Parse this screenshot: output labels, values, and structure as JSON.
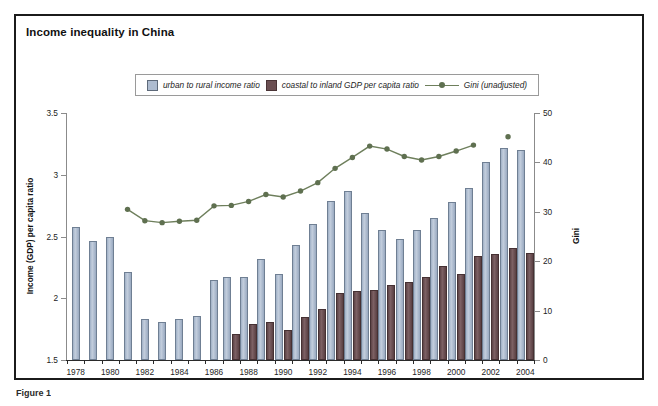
{
  "figure": {
    "title": "Income inequality in China",
    "caption": "Figure 1"
  },
  "legend": {
    "items": [
      {
        "key": "urban_rural",
        "label": "urban to rural income ratio",
        "marker": "blue-square-swatch",
        "color": "#aebcd0"
      },
      {
        "key": "coastal_inland",
        "label": "coastal to inland GDP per capita ratio",
        "marker": "maroon-square-swatch",
        "color": "#6b4f52"
      },
      {
        "key": "gini",
        "label": "Gini (unadjusted)",
        "marker": "line-with-dot",
        "color": "#6e7f5c"
      }
    ]
  },
  "chart_data": {
    "type": "bar",
    "title": "Income inequality in China",
    "xlabel": "",
    "ylabel": "Income (GDP) per capita ratio",
    "y2label": "Gini",
    "ylim": [
      1.5,
      3.5
    ],
    "y2lim": [
      0,
      50
    ],
    "yticks": [
      "1.5",
      "2",
      "2.5",
      "3",
      "3.5"
    ],
    "ytickvalues": [
      1.5,
      2,
      2.5,
      3,
      3.5
    ],
    "y2ticks": [
      "0",
      "10",
      "20",
      "30",
      "40",
      "50"
    ],
    "y2tickvalues": [
      0,
      10,
      20,
      30,
      40,
      50
    ],
    "grid": false,
    "legend_position": "top-center",
    "categories": [
      1978,
      1979,
      1980,
      1981,
      1982,
      1983,
      1984,
      1985,
      1986,
      1987,
      1988,
      1989,
      1990,
      1991,
      1992,
      1993,
      1994,
      1995,
      1996,
      1997,
      1998,
      1999,
      2000,
      2001,
      2002,
      2003,
      2004
    ],
    "xtick_labels": [
      "1978",
      "1980",
      "1982",
      "1984",
      "1986",
      "1988",
      "1990",
      "1992",
      "1994",
      "1996",
      "1998",
      "2000",
      "2002",
      "2004"
    ],
    "xtick_values": [
      1978,
      1980,
      1982,
      1984,
      1986,
      1988,
      1990,
      1992,
      1994,
      1996,
      1998,
      2000,
      2002,
      2004
    ],
    "series": [
      {
        "name": "urban to rural income ratio",
        "axis": "left",
        "color": "#aebcd0",
        "values": [
          2.58,
          2.46,
          2.5,
          2.21,
          1.83,
          1.81,
          1.83,
          1.86,
          2.15,
          2.17,
          2.17,
          2.32,
          2.2,
          2.43,
          2.6,
          2.79,
          2.87,
          2.69,
          2.55,
          2.48,
          2.55,
          2.65,
          2.78,
          2.89,
          3.1,
          3.22,
          3.2
        ]
      },
      {
        "name": "coastal to inland GDP per capita ratio",
        "axis": "left",
        "color": "#6b4f52",
        "values": [
          null,
          null,
          null,
          null,
          null,
          null,
          null,
          null,
          null,
          1.71,
          1.79,
          1.81,
          1.74,
          1.85,
          1.91,
          2.04,
          2.06,
          2.07,
          2.11,
          2.13,
          2.17,
          2.26,
          2.2,
          2.34,
          2.36,
          2.41,
          2.37
        ]
      },
      {
        "name": "Gini (unadjusted)",
        "axis": "right",
        "color": "#6e7f5c",
        "marker": "circle",
        "values": [
          null,
          null,
          null,
          30.5,
          28.2,
          27.8,
          28.1,
          28.3,
          31.2,
          31.3,
          32.1,
          33.5,
          33.0,
          34.2,
          35.9,
          38.8,
          41.0,
          43.3,
          42.7,
          41.2,
          40.5,
          41.2,
          42.3,
          43.5,
          null,
          45.2,
          null
        ]
      }
    ]
  }
}
